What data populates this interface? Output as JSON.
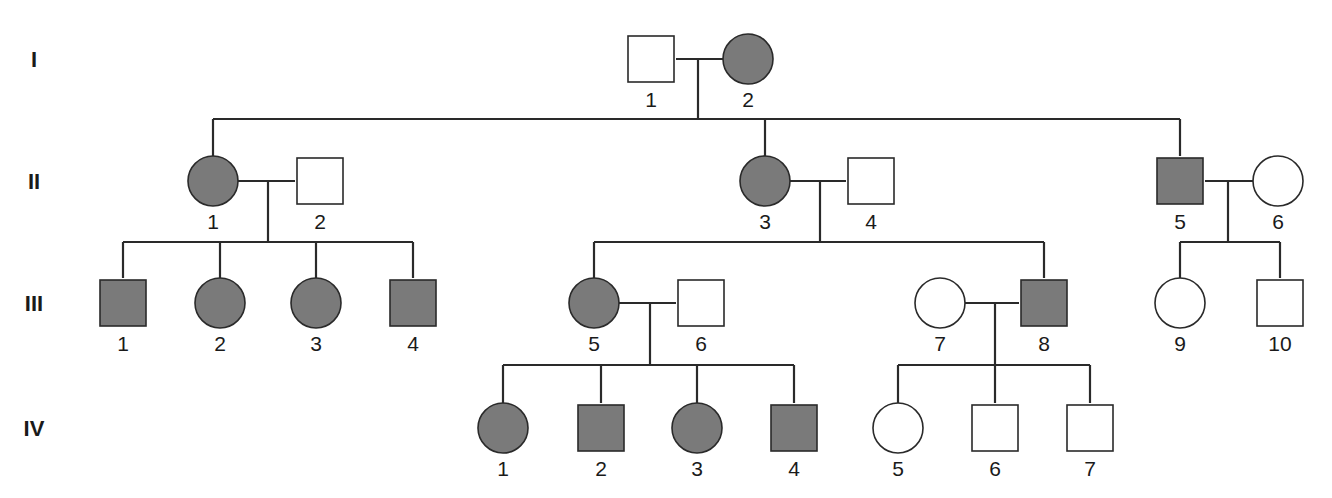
{
  "colors": {
    "affected": "#7a7a7a",
    "unaffected": "#ffffff",
    "stroke": "#2a2a2a"
  },
  "generations": [
    {
      "label": "I",
      "y": 59
    },
    {
      "label": "II",
      "y": 181
    },
    {
      "label": "III",
      "y": 303
    },
    {
      "label": "IV",
      "y": 428
    }
  ],
  "individuals": [
    {
      "id": "I-1",
      "gen": 0,
      "num": "1",
      "sex": "male",
      "affected": false,
      "x": 651
    },
    {
      "id": "I-2",
      "gen": 0,
      "num": "2",
      "sex": "female",
      "affected": true,
      "x": 748
    },
    {
      "id": "II-1",
      "gen": 1,
      "num": "1",
      "sex": "female",
      "affected": true,
      "x": 213
    },
    {
      "id": "II-2",
      "gen": 1,
      "num": "2",
      "sex": "male",
      "affected": false,
      "x": 320
    },
    {
      "id": "II-3",
      "gen": 1,
      "num": "3",
      "sex": "female",
      "affected": true,
      "x": 765
    },
    {
      "id": "II-4",
      "gen": 1,
      "num": "4",
      "sex": "male",
      "affected": false,
      "x": 871
    },
    {
      "id": "II-5",
      "gen": 1,
      "num": "5",
      "sex": "male",
      "affected": true,
      "x": 1180
    },
    {
      "id": "II-6",
      "gen": 1,
      "num": "6",
      "sex": "female",
      "affected": false,
      "x": 1278
    },
    {
      "id": "III-1",
      "gen": 2,
      "num": "1",
      "sex": "male",
      "affected": true,
      "x": 123
    },
    {
      "id": "III-2",
      "gen": 2,
      "num": "2",
      "sex": "female",
      "affected": true,
      "x": 220
    },
    {
      "id": "III-3",
      "gen": 2,
      "num": "3",
      "sex": "female",
      "affected": true,
      "x": 316
    },
    {
      "id": "III-4",
      "gen": 2,
      "num": "4",
      "sex": "male",
      "affected": true,
      "x": 413
    },
    {
      "id": "III-5",
      "gen": 2,
      "num": "5",
      "sex": "female",
      "affected": true,
      "x": 594
    },
    {
      "id": "III-6",
      "gen": 2,
      "num": "6",
      "sex": "male",
      "affected": false,
      "x": 701
    },
    {
      "id": "III-7",
      "gen": 2,
      "num": "7",
      "sex": "female",
      "affected": false,
      "x": 940
    },
    {
      "id": "III-8",
      "gen": 2,
      "num": "8",
      "sex": "male",
      "affected": true,
      "x": 1044
    },
    {
      "id": "III-9",
      "gen": 2,
      "num": "9",
      "sex": "female",
      "affected": false,
      "x": 1180
    },
    {
      "id": "III-10",
      "gen": 2,
      "num": "10",
      "sex": "male",
      "affected": false,
      "x": 1280
    },
    {
      "id": "IV-1",
      "gen": 3,
      "num": "1",
      "sex": "female",
      "affected": true,
      "x": 503
    },
    {
      "id": "IV-2",
      "gen": 3,
      "num": "2",
      "sex": "male",
      "affected": true,
      "x": 601
    },
    {
      "id": "IV-3",
      "gen": 3,
      "num": "3",
      "sex": "female",
      "affected": true,
      "x": 697
    },
    {
      "id": "IV-4",
      "gen": 3,
      "num": "4",
      "sex": "male",
      "affected": true,
      "x": 794
    },
    {
      "id": "IV-5",
      "gen": 3,
      "num": "5",
      "sex": "female",
      "affected": false,
      "x": 898
    },
    {
      "id": "IV-6",
      "gen": 3,
      "num": "6",
      "sex": "male",
      "affected": false,
      "x": 995
    },
    {
      "id": "IV-7",
      "gen": 3,
      "num": "7",
      "sex": "male",
      "affected": false,
      "x": 1090
    }
  ],
  "matings": [
    {
      "a": "I-1",
      "b": "I-2",
      "drop_x": 698,
      "sib_y": 119,
      "children": [
        "II-1",
        "II-3",
        "II-5"
      ]
    },
    {
      "a": "II-1",
      "b": "II-2",
      "drop_x": 268,
      "sib_y": 242,
      "children": [
        "III-1",
        "III-2",
        "III-3",
        "III-4"
      ]
    },
    {
      "a": "II-3",
      "b": "II-4",
      "drop_x": 820,
      "sib_y": 242,
      "children": [
        "III-5",
        "III-8"
      ]
    },
    {
      "a": "II-5",
      "b": "II-6",
      "drop_x": 1228,
      "sib_y": 242,
      "children": [
        "III-9",
        "III-10"
      ]
    },
    {
      "a": "III-5",
      "b": "III-6",
      "drop_x": 650,
      "sib_y": 365,
      "children": [
        "IV-1",
        "IV-2",
        "IV-3",
        "IV-4"
      ]
    },
    {
      "a": "III-7",
      "b": "III-8",
      "drop_x": 995,
      "sib_y": 365,
      "children": [
        "IV-5",
        "IV-6",
        "IV-7"
      ]
    }
  ]
}
